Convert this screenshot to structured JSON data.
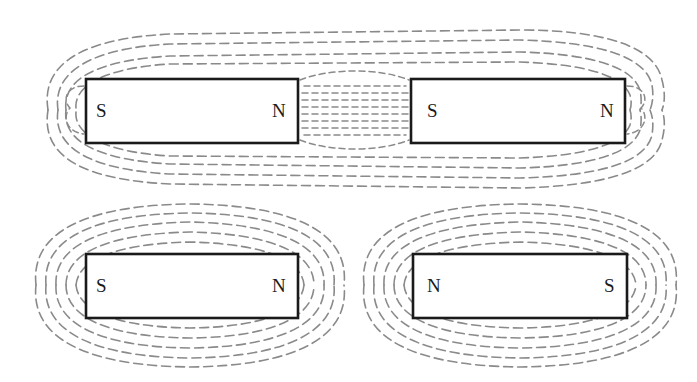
{
  "figure": {
    "colors": {
      "field_line": "#8a8a8a",
      "magnet_outline": "#1a1a1a",
      "background": "#ffffff"
    },
    "panels": [
      {
        "name": "top-panel-attracting",
        "magnets": [
          {
            "left_pole": "S",
            "right_pole": "N"
          },
          {
            "left_pole": "S",
            "right_pole": "N"
          }
        ]
      },
      {
        "name": "bottom-left-panel",
        "magnets": [
          {
            "left_pole": "S",
            "right_pole": "N"
          }
        ]
      },
      {
        "name": "bottom-right-panel",
        "magnets": [
          {
            "left_pole": "N",
            "right_pole": "S"
          }
        ]
      }
    ]
  }
}
